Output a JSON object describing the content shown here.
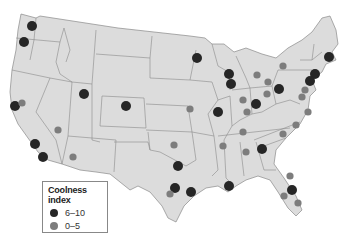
{
  "map": {
    "subject": "Contiguous United States",
    "colors": {
      "land": "#dcdcdc",
      "border": "#8a8a8a",
      "high": "#262626",
      "low": "#7d7d7d"
    },
    "cities": [
      {
        "name": "Seattle",
        "category": "6-10"
      },
      {
        "name": "Portland",
        "category": "6-10"
      },
      {
        "name": "San Francisco",
        "category": "6-10"
      },
      {
        "name": "Sacramento",
        "category": "0-5"
      },
      {
        "name": "Los Angeles",
        "category": "6-10"
      },
      {
        "name": "San Diego",
        "category": "6-10"
      },
      {
        "name": "Las Vegas",
        "category": "0-5"
      },
      {
        "name": "Phoenix",
        "category": "0-5"
      },
      {
        "name": "Salt Lake City",
        "category": "6-10"
      },
      {
        "name": "Denver",
        "category": "6-10"
      },
      {
        "name": "Kansas City",
        "category": "0-5"
      },
      {
        "name": "Oklahoma City",
        "category": "0-5"
      },
      {
        "name": "Dallas",
        "category": "6-10"
      },
      {
        "name": "Austin",
        "category": "6-10"
      },
      {
        "name": "San Antonio",
        "category": "0-5"
      },
      {
        "name": "Houston",
        "category": "6-10"
      },
      {
        "name": "Minneapolis",
        "category": "6-10"
      },
      {
        "name": "Milwaukee",
        "category": "6-10"
      },
      {
        "name": "Chicago",
        "category": "6-10"
      },
      {
        "name": "St. Louis",
        "category": "6-10"
      },
      {
        "name": "Detroit",
        "category": "0-5"
      },
      {
        "name": "Indianapolis",
        "category": "0-5"
      },
      {
        "name": "Columbus",
        "category": "0-5"
      },
      {
        "name": "Cincinnati",
        "category": "6-10"
      },
      {
        "name": "Louisville",
        "category": "0-5"
      },
      {
        "name": "Cleveland",
        "category": "0-5"
      },
      {
        "name": "Buffalo",
        "category": "0-5"
      },
      {
        "name": "Pittsburgh",
        "category": "6-10"
      },
      {
        "name": "Boston",
        "category": "6-10"
      },
      {
        "name": "New York",
        "category": "6-10"
      },
      {
        "name": "Philadelphia",
        "category": "6-10"
      },
      {
        "name": "Baltimore",
        "category": "0-5"
      },
      {
        "name": "Washington",
        "category": "0-5"
      },
      {
        "name": "Richmond",
        "category": "0-5"
      },
      {
        "name": "Raleigh",
        "category": "0-5"
      },
      {
        "name": "Charlotte",
        "category": "0-5"
      },
      {
        "name": "Nashville",
        "category": "0-5"
      },
      {
        "name": "Memphis",
        "category": "0-5"
      },
      {
        "name": "Birmingham",
        "category": "0-5"
      },
      {
        "name": "Atlanta",
        "category": "6-10"
      },
      {
        "name": "New Orleans",
        "category": "6-10"
      },
      {
        "name": "Jacksonville",
        "category": "0-5"
      },
      {
        "name": "Orlando",
        "category": "6-10"
      },
      {
        "name": "Tampa",
        "category": "0-5"
      },
      {
        "name": "Miami",
        "category": "0-5"
      }
    ]
  },
  "legend": {
    "title": "Coolness index",
    "items": [
      {
        "label": "6–10",
        "category": "6-10",
        "color": "#262626"
      },
      {
        "label": "0–5",
        "category": "0-5",
        "color": "#7d7d7d"
      }
    ]
  }
}
